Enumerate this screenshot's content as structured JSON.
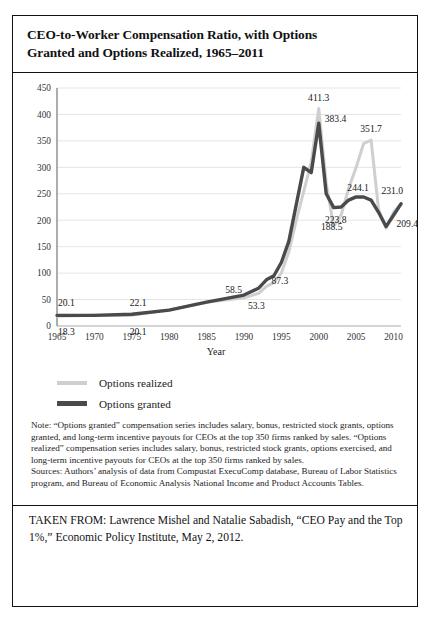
{
  "figure": {
    "title_line1": "CEO-to-Worker Compensation Ratio, with Options",
    "title_line2": "Granted and Options Realized, 1965–2011"
  },
  "chart_data": {
    "type": "line",
    "title": "CEO-to-Worker Compensation Ratio, with Options Granted and Options Realized, 1965–2011",
    "xlabel": "Year",
    "ylabel": "",
    "xlim": [
      1965,
      2011
    ],
    "ylim": [
      0,
      450
    ],
    "ytick_step": 50,
    "yticks": [
      "0",
      "50",
      "100",
      "150",
      "200",
      "250",
      "300",
      "350",
      "400",
      "450"
    ],
    "xticks": [
      "1965",
      "1970",
      "1975",
      "1980",
      "1985",
      "1990",
      "1995",
      "2000",
      "2005",
      "2010"
    ],
    "grid": "horizontal",
    "legend_position": "below-plot-left",
    "series": [
      {
        "name": "Options realized",
        "color": "#cfcfcf",
        "x": [
          1965,
          1970,
          1975,
          1980,
          1985,
          1990,
          1992,
          1993,
          1994,
          1995,
          1996,
          1997,
          1998,
          1999,
          2000,
          2001,
          2002,
          2003,
          2004,
          2005,
          2006,
          2007,
          2008,
          2009,
          2010,
          2011
        ],
        "values": [
          18.3,
          20.1,
          20.1,
          30.5,
          45.0,
          53.3,
          62.0,
          75.0,
          82.0,
          100.0,
          140.0,
          200.0,
          255.0,
          310.0,
          411.3,
          270.0,
          188.5,
          210.0,
          260.0,
          300.0,
          345.0,
          351.7,
          220.0,
          185.0,
          215.0,
          231.0
        ]
      },
      {
        "name": "Options granted",
        "color": "#4a4a4a",
        "x": [
          1965,
          1970,
          1975,
          1980,
          1985,
          1990,
          1992,
          1993,
          1994,
          1995,
          1996,
          1997,
          1998,
          1999,
          2000,
          2001,
          2002,
          2003,
          2004,
          2005,
          2006,
          2007,
          2008,
          2009,
          2010,
          2011
        ],
        "values": [
          20.1,
          20.0,
          22.1,
          30.0,
          45.0,
          58.5,
          72.0,
          87.3,
          95.0,
          120.0,
          160.0,
          230.0,
          300.0,
          290.0,
          383.4,
          250.0,
          223.8,
          225.0,
          238.0,
          244.1,
          244.0,
          238.0,
          215.0,
          188.0,
          209.4,
          231.0
        ]
      }
    ],
    "point_labels": [
      {
        "text": "20.1",
        "x": 1965,
        "y": 20.1,
        "series": "Options granted",
        "place": "above-left"
      },
      {
        "text": "18.3",
        "x": 1965,
        "y": 18.3,
        "series": "Options realized",
        "place": "below-left"
      },
      {
        "text": "22.1",
        "x": 1975,
        "y": 22.1,
        "series": "Options granted",
        "place": "above"
      },
      {
        "text": "20.1",
        "x": 1975,
        "y": 20.1,
        "series": "Options realized",
        "place": "below"
      },
      {
        "text": "58.5",
        "x": 1990,
        "y": 58.5,
        "series": "Options granted",
        "place": "above-left"
      },
      {
        "text": "53.3",
        "x": 1990,
        "y": 53.3,
        "series": "Options realized",
        "place": "below-right"
      },
      {
        "text": "87.3",
        "x": 1993,
        "y": 87.3,
        "series": "Options granted",
        "place": "below-right"
      },
      {
        "text": "411.3",
        "x": 2000,
        "y": 411.3,
        "series": "Options realized",
        "place": "above"
      },
      {
        "text": "383.4",
        "x": 2000,
        "y": 383.4,
        "series": "Options granted",
        "place": "right"
      },
      {
        "text": "351.7",
        "x": 2007,
        "y": 351.7,
        "series": "Options realized",
        "place": "above"
      },
      {
        "text": "223.8",
        "x": 2002,
        "y": 223.8,
        "series": "Options granted",
        "place": "below"
      },
      {
        "text": "188.5",
        "x": 2002,
        "y": 188.5,
        "series": "Options realized",
        "place": "below"
      },
      {
        "text": "244.1",
        "x": 2005,
        "y": 244.1,
        "series": "Options granted",
        "place": "above"
      },
      {
        "text": "231.0",
        "x": 2011,
        "y": 231.0,
        "series": "Options realized",
        "place": "above-right"
      },
      {
        "text": "209.4",
        "x": 2010,
        "y": 209.4,
        "series": "Options granted",
        "place": "below-right"
      }
    ]
  },
  "legend": {
    "items": [
      {
        "label": "Options realized",
        "color": "#cfcfcf"
      },
      {
        "label": "Options granted",
        "color": "#4a4a4a"
      }
    ]
  },
  "notes": {
    "note": "Note: “Options granted” compensation series includes salary, bonus, restricted stock grants, options granted, and long-term incentive payouts for CEOs at the top 350 firms ranked by sales. “Options realized” compensation series includes salary, bonus, restricted stock grants, options exercised, and long-term incentive payouts for CEOs at the top 350 firms ranked by sales.",
    "sources": "Sources: Authors’ analysis of data from Compustat ExecuComp database, Bureau of Labor Statistics program, and Bureau of Economic Analysis National Income and Product Accounts Tables."
  },
  "taken_from": {
    "text": "TAKEN FROM: Lawrence Mishel and Natalie Sabadish, “CEO Pay and the Top 1%,” Economic Policy Institute, May 2, 2012."
  }
}
